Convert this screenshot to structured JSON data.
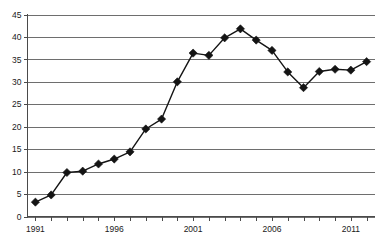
{
  "chart_data": {
    "type": "line",
    "title": "",
    "subtitle": "",
    "xlabel": "",
    "ylabel": "",
    "x": [
      1991,
      1992,
      1993,
      1994,
      1995,
      1996,
      1997,
      1998,
      1999,
      2000,
      2001,
      2002,
      2003,
      2004,
      2005,
      2006,
      2007,
      2008,
      2009,
      2010,
      2011,
      2012
    ],
    "values": [
      3.2,
      4.8,
      9.8,
      10.1,
      11.7,
      12.8,
      14.4,
      19.5,
      21.7,
      30.0,
      36.4,
      35.9,
      39.8,
      41.8,
      39.3,
      37.0,
      32.2,
      28.7,
      32.3,
      32.8,
      32.6,
      34.5
    ],
    "series": [
      {
        "name": "series-1",
        "values": [
          3.2,
          4.8,
          9.8,
          10.1,
          11.7,
          12.8,
          14.4,
          19.5,
          21.7,
          30.0,
          36.4,
          35.9,
          39.8,
          41.8,
          39.3,
          37.0,
          32.2,
          28.7,
          32.3,
          32.8,
          32.6,
          34.5
        ]
      }
    ],
    "xlim": [
      1990.5,
      2012.5
    ],
    "ylim": [
      0,
      45
    ],
    "y_ticks": [
      0,
      5,
      10,
      15,
      20,
      25,
      30,
      35,
      40,
      45
    ],
    "y_tick_labels": [
      "0",
      "5",
      "10",
      "15",
      "20",
      "25",
      "30",
      "35",
      "40",
      "45"
    ],
    "x_ticks": [
      1991,
      1992,
      1993,
      1994,
      1995,
      1996,
      1997,
      1998,
      1999,
      2000,
      2001,
      2002,
      2003,
      2004,
      2005,
      2006,
      2007,
      2008,
      2009,
      2010,
      2011,
      2012
    ],
    "x_tick_labels_shown": [
      "1991",
      "1996",
      "2001",
      "2006",
      "2011"
    ],
    "x_labeled_ticks": [
      1991,
      1996,
      2001,
      2006,
      2011
    ],
    "grid": true,
    "grid_axis": "y",
    "legend": false,
    "legend_position": "none",
    "marker": "diamond",
    "line_color": "#141414",
    "marker_color": "#141414",
    "grid_color": "#6e6e6e",
    "axis_color": "#4a4a4a",
    "background_color": "#ffffff",
    "annotations": []
  }
}
